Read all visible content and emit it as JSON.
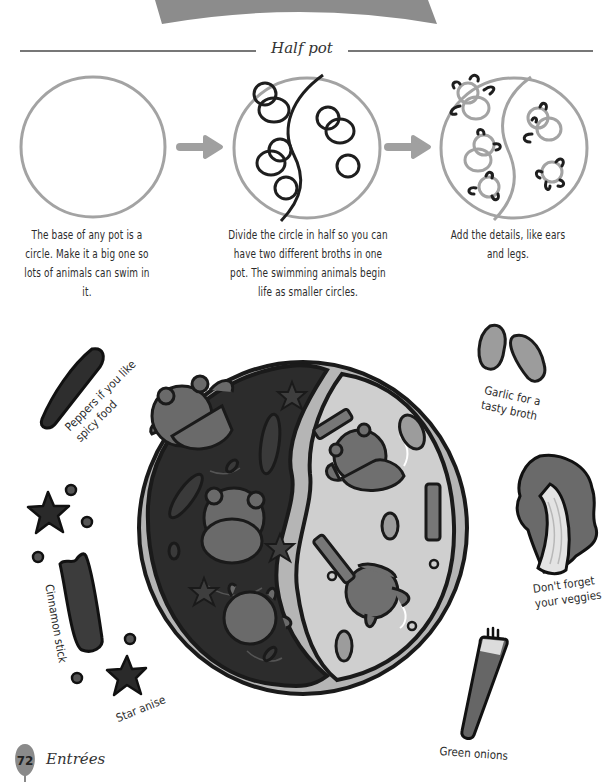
{
  "page": {
    "section_title": "Half pot",
    "page_number": "72",
    "chapter": "Entrées"
  },
  "steps": [
    {
      "id": "step-1",
      "text": "The base of any pot is a circle. Make it a big one so lots of animals can swim in it."
    },
    {
      "id": "step-2",
      "text": "Divide the circle in half so you can have two different broths in one pot. The swimming animals begin life as smaller circles."
    },
    {
      "id": "step-3",
      "text": "Add the details, like ears and legs."
    }
  ],
  "ingredient_labels": {
    "peppers": "Peppers if you like spicy food",
    "garlic": "Garlic for a tasty broth",
    "veggies": "Don't forget your veggies",
    "cinnamon": "Cinnamon stick",
    "star_anise": "Star anise",
    "green_onions": "Green onions"
  },
  "icons": {
    "arrow": "arrow-right-icon",
    "pot": "hot-pot-illustration",
    "bear": "bear-icon",
    "star_anise": "star-anise-icon",
    "chili": "chili-pepper-icon",
    "garlic": "garlic-clove-icon",
    "bok_choy": "bok-choy-icon",
    "green_onion": "green-onion-icon",
    "cinnamon": "cinnamon-stick-icon"
  },
  "colors": {
    "header_banner": "#8c8c8c",
    "outline_light": "#9a9a9a",
    "ink": "#1e1e1e",
    "dark_broth": "#2c2c2c",
    "light_broth": "#cfcfcf",
    "bear_dark": "#6a6a6a",
    "bear_mid": "#7a7a7a",
    "rim": "#b5b5b5",
    "page_badge": "#8a8a8a"
  }
}
